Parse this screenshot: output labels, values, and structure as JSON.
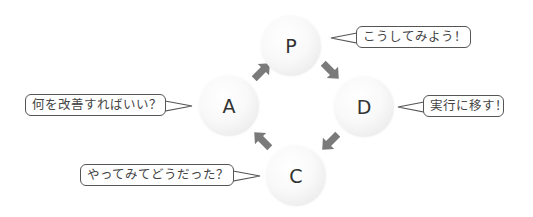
{
  "diagram": {
    "type": "PDCA cycle",
    "nodes": [
      {
        "id": "P",
        "label": "P",
        "comment": "こうしてみよう！"
      },
      {
        "id": "D",
        "label": "D",
        "comment": "実行に移す！"
      },
      {
        "id": "C",
        "label": "C",
        "comment": "やってみてどうだった？"
      },
      {
        "id": "A",
        "label": "A",
        "comment": "何を改善すればいい？"
      }
    ],
    "edges": [
      {
        "from": "P",
        "to": "D"
      },
      {
        "from": "D",
        "to": "C"
      },
      {
        "from": "C",
        "to": "A"
      },
      {
        "from": "A",
        "to": "P"
      }
    ],
    "colors": {
      "arrow": "#7a7a7a",
      "bubble_border": "#555555",
      "node_text": "#333333"
    }
  }
}
